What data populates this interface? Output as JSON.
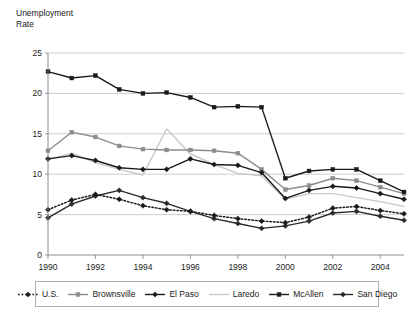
{
  "chart_data": {
    "type": "line",
    "title": "",
    "ylabel": "Unemployment\nRate",
    "xlabel": "",
    "ylim": [
      0,
      25
    ],
    "ytick_values": [
      0,
      5,
      10,
      15,
      20,
      25
    ],
    "ytick_labels": [
      "0",
      "5",
      "10",
      "15",
      "20",
      "25"
    ],
    "xlim": [
      1990,
      2005
    ],
    "x": [
      1990,
      1991,
      1992,
      1993,
      1994,
      1995,
      1996,
      1997,
      1998,
      1999,
      2000,
      2001,
      2002,
      2003,
      2004,
      2005
    ],
    "xtick_values": [
      1990,
      1992,
      1994,
      1996,
      1998,
      2000,
      2002,
      2004
    ],
    "xtick_labels": [
      "1990",
      "1992",
      "1994",
      "1996",
      "1998",
      "2000",
      "2002",
      "2004"
    ],
    "grid": "horizontal",
    "legend_position": "bottom",
    "series": [
      {
        "name": "U.S.",
        "color": "#1a1a1a",
        "style": "dotted",
        "marker": "diamond",
        "values": [
          5.6,
          6.8,
          7.5,
          6.9,
          6.1,
          5.6,
          5.4,
          4.9,
          4.5,
          4.2,
          4.0,
          4.7,
          5.8,
          6.0,
          5.5,
          5.1
        ]
      },
      {
        "name": "Brownsville",
        "color": "#8c8c8c",
        "style": "solid",
        "marker": "square",
        "values": [
          12.9,
          15.2,
          14.6,
          13.5,
          13.1,
          13.0,
          13.0,
          12.9,
          12.6,
          10.6,
          8.1,
          8.6,
          9.5,
          9.2,
          8.4,
          7.6
        ]
      },
      {
        "name": "El Paso",
        "color": "#1a1a1a",
        "style": "solid",
        "marker": "diamond",
        "values": [
          11.9,
          12.3,
          11.7,
          10.8,
          10.6,
          10.6,
          11.9,
          11.2,
          11.1,
          10.2,
          7.0,
          8.0,
          8.5,
          8.3,
          7.6,
          6.9
        ]
      },
      {
        "name": "Laredo",
        "color": "#c9c9c9",
        "style": "solid",
        "marker": "none",
        "values": [
          11.8,
          12.6,
          11.4,
          10.6,
          9.9,
          15.6,
          12.5,
          11.2,
          10.1,
          9.8,
          6.9,
          7.6,
          7.6,
          7.1,
          6.6,
          6.0
        ]
      },
      {
        "name": "McAllen",
        "color": "#1a1a1a",
        "style": "solid",
        "marker": "square",
        "values": [
          22.7,
          21.9,
          22.2,
          20.5,
          20.0,
          20.1,
          19.5,
          18.3,
          18.4,
          18.3,
          9.5,
          10.4,
          10.6,
          10.6,
          9.2,
          7.8
        ]
      },
      {
        "name": "San Diego",
        "color": "#2b2b2b",
        "style": "solid",
        "marker": "diamond",
        "values": [
          4.6,
          6.3,
          7.3,
          8.0,
          7.1,
          6.4,
          5.4,
          4.5,
          3.9,
          3.3,
          3.6,
          4.2,
          5.2,
          5.4,
          4.8,
          4.3
        ]
      }
    ]
  }
}
